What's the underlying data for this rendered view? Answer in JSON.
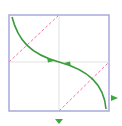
{
  "diagram": {
    "type": "phase-portrait",
    "colors": {
      "frame": "#a9a9dc",
      "axes": "#d9d9d9",
      "diagonal": "#f07aa0",
      "curve": "#3c9a3c",
      "arrow": "#3aaa3a"
    },
    "frame": {
      "x": 9,
      "y": 15,
      "width": 100,
      "height": 96
    },
    "center": {
      "x": 59,
      "y": 62
    },
    "icons": {
      "center_arrows": "arrow-icon",
      "right_marker": "triangle-right-icon",
      "bottom_marker": "triangle-down-icon"
    }
  }
}
